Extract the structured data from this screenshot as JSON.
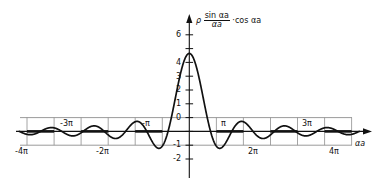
{
  "chart_data": {
    "type": "line",
    "title": "",
    "subtitle": "",
    "ylabel_parts": {
      "rho": "ρ",
      "numerator": "sin αa",
      "denominator": "αa",
      "operator": "·",
      "trailing": "cos αa"
    },
    "ylabel": "ρ (sin αa / αa) · cos αa",
    "xlabel": "αa",
    "xlim": [
      -12.566,
      12.566
    ],
    "ylim": [
      -2.6,
      6.6
    ],
    "grid": false,
    "guide_lines": [
      1,
      -1
    ],
    "legend": "none",
    "x_unit": "π",
    "xticks": [
      {
        "value": -12.566,
        "label": "-4π",
        "position": "below"
      },
      {
        "value": -9.425,
        "label": "-3π",
        "position": "above"
      },
      {
        "value": -6.283,
        "label": "-2π",
        "position": "below"
      },
      {
        "value": -3.142,
        "label": "-π",
        "position": "above"
      },
      {
        "value": 3.142,
        "label": "π",
        "position": "above"
      },
      {
        "value": 6.283,
        "label": "2π",
        "position": "below"
      },
      {
        "value": 9.425,
        "label": "3π",
        "position": "above"
      },
      {
        "value": 12.566,
        "label": "4π",
        "position": "below"
      }
    ],
    "yticks": [
      {
        "value": 6,
        "label": "6"
      },
      {
        "value": 5,
        "label": ""
      },
      {
        "value": 4,
        "label": "4"
      },
      {
        "value": 3,
        "label": "3"
      },
      {
        "value": 2,
        "label": "2"
      },
      {
        "value": 1,
        "label": "1"
      },
      {
        "value": 0,
        "label": "0"
      },
      {
        "value": -1,
        "label": "-1"
      },
      {
        "value": -2,
        "label": "-2"
      }
    ],
    "series": [
      {
        "name": "ρ sin(αa)/(αa) · cos(αa)",
        "amplitude": 5.65,
        "color": "#111111",
        "key_points": [
          {
            "x": -12.566,
            "y": 1.0,
            "note": "left endpoint on +1 guide line"
          },
          {
            "x": -11.0,
            "y": -1.1,
            "note": "local minimum"
          },
          {
            "x": -9.425,
            "y": 0.0,
            "note": "zero crossing at -3π"
          },
          {
            "x": -7.85,
            "y": 1.3,
            "note": "local maximum"
          },
          {
            "x": -6.283,
            "y": 0.0,
            "note": "zero crossing at -2π"
          },
          {
            "x": -4.71,
            "y": -1.75,
            "note": "local minimum"
          },
          {
            "x": -3.142,
            "y": 0.0,
            "note": "zero crossing at -π"
          },
          {
            "x": 0.0,
            "y": 5.65,
            "note": "central maximum"
          },
          {
            "x": 3.142,
            "y": 0.0,
            "note": "zero crossing at π"
          },
          {
            "x": 4.71,
            "y": -1.75,
            "note": "local minimum"
          },
          {
            "x": 6.283,
            "y": 0.0,
            "note": "zero crossing at 2π"
          },
          {
            "x": 7.85,
            "y": 1.3,
            "note": "local maximum"
          },
          {
            "x": 9.425,
            "y": 0.0,
            "note": "zero crossing at 3π"
          },
          {
            "x": 11.0,
            "y": -1.1,
            "note": "local minimum"
          },
          {
            "x": 12.566,
            "y": 1.0,
            "note": "right endpoint on +1 guide line"
          }
        ]
      }
    ]
  }
}
